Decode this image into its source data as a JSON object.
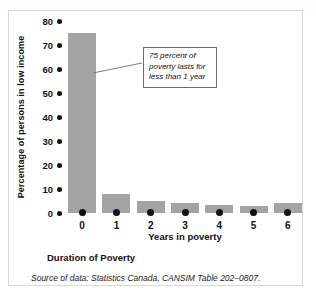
{
  "figure": {
    "caption": "Duration of Poverty",
    "source": "Source of data: Statistics Canada, CANSIM Table 202–0807."
  },
  "annotation": {
    "line1": "75 percent of",
    "line2": "poverty lasts for",
    "line3": "less than 1 year"
  },
  "colors": {
    "bar": "#a3a3a3",
    "axis_text": "#111111",
    "panel_border": "#d9d9d9",
    "callout_border": "#6d6d6d",
    "background": "#ffffff"
  },
  "chart_data": {
    "type": "bar",
    "title": "Duration of Poverty",
    "xlabel": "Years in poverty",
    "ylabel": "Percentage of persons in low income",
    "categories": [
      "0",
      "1",
      "2",
      "3",
      "4",
      "5",
      "6"
    ],
    "values": [
      75,
      8,
      5,
      4,
      3.5,
      3,
      4
    ],
    "ylim": [
      0,
      80
    ],
    "yticks": [
      0,
      10,
      20,
      30,
      40,
      50,
      60,
      70,
      80
    ],
    "ytick_labels": [
      "0",
      "10",
      "20",
      "30",
      "40",
      "50",
      "60",
      "70",
      "80"
    ],
    "grid": false,
    "legend": "none",
    "annotations": [
      {
        "text": "75 percent of poverty lasts for less than 1 year",
        "points_to_category": "0"
      }
    ]
  }
}
